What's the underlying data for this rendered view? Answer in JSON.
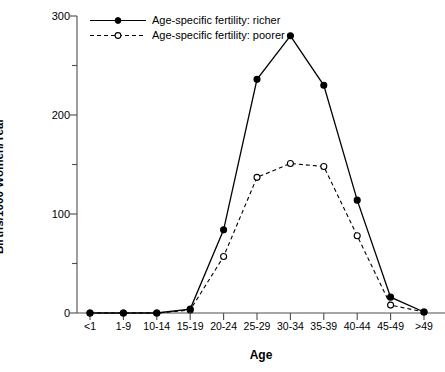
{
  "chart_data": {
    "type": "line",
    "title": "",
    "xlabel": "Age",
    "ylabel": "Births/1000 Women/Year",
    "categories": [
      "<1",
      "1-9",
      "10-14",
      "15-19",
      "20-24",
      "25-29",
      "30-34",
      "35-39",
      "40-44",
      "45-49",
      ">49"
    ],
    "ylim": [
      0,
      300
    ],
    "yticks": [
      0,
      100,
      200,
      300
    ],
    "yticklabels": [
      "0",
      "100",
      "200",
      "300"
    ],
    "yminorticks": [
      50,
      150,
      250
    ],
    "grid": false,
    "legend_position": "upper left (inside axes)",
    "series": [
      {
        "name": "Age-specific fertility: richer",
        "style": "solid",
        "marker": "filled-circle",
        "color": "#000000",
        "values": [
          0,
          0,
          0,
          4,
          84,
          236,
          280,
          230,
          114,
          16,
          1
        ]
      },
      {
        "name": "Age-specific fertility: poorer",
        "style": "dashed",
        "marker": "open-circle",
        "color": "#000000",
        "values": [
          0,
          0,
          0,
          3,
          57,
          137,
          151,
          148,
          78,
          8,
          1
        ]
      }
    ]
  },
  "axes": {
    "y_title": "Births/1000 Women/Year",
    "x_title": "Age"
  },
  "legend": {
    "items": [
      {
        "label": "Age-specific fertility: richer",
        "key": "solid-filled-circle"
      },
      {
        "label": "Age-specific fertility: poorer",
        "key": "dashed-open-circle"
      }
    ]
  }
}
